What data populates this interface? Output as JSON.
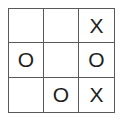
{
  "diagram": {
    "grid_size": "3x3",
    "colors": {
      "background": "#ffffff",
      "grid_line": "#595959",
      "mark": "#1f1f1f"
    },
    "cells": [
      {
        "row": 1,
        "col": 1,
        "mark": ""
      },
      {
        "row": 1,
        "col": 2,
        "mark": ""
      },
      {
        "row": 1,
        "col": 3,
        "mark": "X"
      },
      {
        "row": 2,
        "col": 1,
        "mark": "O"
      },
      {
        "row": 2,
        "col": 2,
        "mark": ""
      },
      {
        "row": 2,
        "col": 3,
        "mark": "O"
      },
      {
        "row": 3,
        "col": 1,
        "mark": ""
      },
      {
        "row": 3,
        "col": 2,
        "mark": "O"
      },
      {
        "row": 3,
        "col": 3,
        "mark": "X"
      }
    ]
  }
}
